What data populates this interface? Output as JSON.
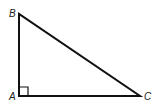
{
  "diagram": {
    "type": "right-triangle",
    "vertices": [
      {
        "label": "B",
        "x": 19,
        "y": 14
      },
      {
        "label": "A",
        "x": 19,
        "y": 96
      },
      {
        "label": "C",
        "x": 140,
        "y": 96
      }
    ],
    "right_angle_at": "A",
    "stroke_color": "#111111",
    "labels": {
      "B": "B",
      "A": "A",
      "C": "C"
    }
  }
}
